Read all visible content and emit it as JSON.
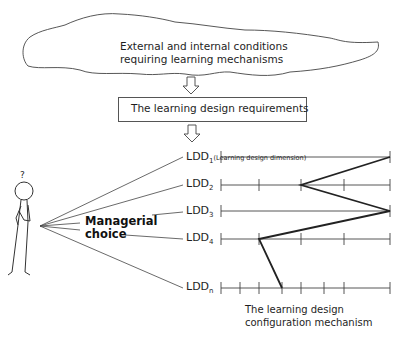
{
  "cloud": {
    "line1": "External and internal conditions",
    "line2": "requiring learning mechanisms"
  },
  "requirements_box": {
    "label": "The learning design requirements"
  },
  "person": {
    "question_mark": "?"
  },
  "managerial_choice": {
    "line1": "Managerial",
    "line2": "choice"
  },
  "dimensions": [
    {
      "label": "LDD",
      "sub": "1",
      "note": "(Learning design dimension)",
      "ticks": 2,
      "selected_position": "right-end"
    },
    {
      "label": "LDD",
      "sub": "2",
      "note": "",
      "ticks": 5,
      "selected_position": "tick 3"
    },
    {
      "label": "LDD",
      "sub": "3",
      "note": "",
      "ticks": 2,
      "selected_position": "right-end"
    },
    {
      "label": "LDD",
      "sub": "4",
      "note": "",
      "ticks": 5,
      "selected_position": "tick 2"
    },
    {
      "label": "LDD",
      "sub": "n",
      "note": "",
      "ticks": 8,
      "selected_position": "tick 4"
    }
  ],
  "configuration": {
    "line1": "The learning design",
    "line2": "configuration mechanism"
  },
  "colors": {
    "line": "#333333",
    "path": "#222222",
    "background": "#ffffff"
  }
}
